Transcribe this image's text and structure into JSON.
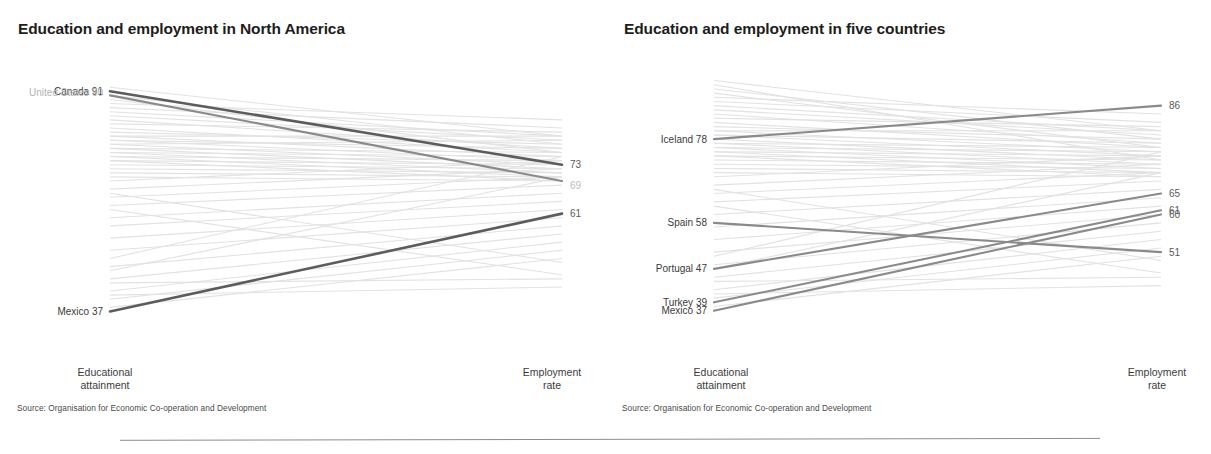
{
  "panels": [
    {
      "id": "north-america",
      "title": "Education and employment in North America",
      "axis_left": "Educational\nattainment",
      "axis_right": "Employment\nrate",
      "source": "Source: Organisation for Economic Co-operation and Development"
    },
    {
      "id": "five-countries",
      "title": "Education and employment in five countries",
      "axis_left": "Educational\nattainment",
      "axis_right": "Employment\nrate",
      "source": "Source: Organisation for Economic Co-operation and Development"
    }
  ],
  "colors": {
    "highlight_dark": "#5c5c5c",
    "highlight_mid": "#8a8a8a",
    "background_line": "#e2e2e2",
    "label_text": "#3a3a3a",
    "label_dim": "#b8b8b8",
    "title_text": "#1d1d1b",
    "rule": "#8d8d8d"
  },
  "chart_data": [
    {
      "type": "line",
      "subtype": "slopegraph",
      "title": "Education and employment in North America",
      "xlabel": "",
      "ylabel": "",
      "categories": [
        "Educational attainment",
        "Employment rate"
      ],
      "ylim": [
        30,
        95
      ],
      "grid": false,
      "legend": "none",
      "highlighted": [
        {
          "name": "Canada",
          "left_label": "Canada 91",
          "right_label": "73",
          "values": [
            91,
            73
          ],
          "emphasis": "dark"
        },
        {
          "name": "United States",
          "left_label": "United States 90",
          "right_label": "69",
          "values": [
            90,
            69
          ],
          "emphasis": "mid"
        },
        {
          "name": "Mexico",
          "left_label": "Mexico 37",
          "right_label": "61",
          "values": [
            37,
            61
          ],
          "emphasis": "dark"
        }
      ],
      "background_series": [
        {
          "values": [
            92,
            80
          ]
        },
        {
          "values": [
            90,
            78
          ]
        },
        {
          "values": [
            89,
            76
          ]
        },
        {
          "values": [
            88,
            84
          ]
        },
        {
          "values": [
            87,
            82
          ]
        },
        {
          "values": [
            86,
            80
          ]
        },
        {
          "values": [
            85,
            79
          ]
        },
        {
          "values": [
            84,
            77
          ]
        },
        {
          "values": [
            83,
            81
          ]
        },
        {
          "values": [
            82,
            76
          ]
        },
        {
          "values": [
            81,
            78
          ]
        },
        {
          "values": [
            80,
            75
          ]
        },
        {
          "values": [
            80,
            80
          ]
        },
        {
          "values": [
            79,
            74
          ]
        },
        {
          "values": [
            79,
            77
          ]
        },
        {
          "values": [
            78,
            73
          ]
        },
        {
          "values": [
            78,
            79
          ]
        },
        {
          "values": [
            77,
            72
          ]
        },
        {
          "values": [
            77,
            76
          ]
        },
        {
          "values": [
            76,
            71
          ]
        },
        {
          "values": [
            76,
            75
          ]
        },
        {
          "values": [
            75,
            74
          ]
        },
        {
          "values": [
            75,
            70
          ]
        },
        {
          "values": [
            74,
            73
          ]
        },
        {
          "values": [
            74,
            69
          ]
        },
        {
          "values": [
            73,
            72
          ]
        },
        {
          "values": [
            72,
            71
          ]
        },
        {
          "values": [
            71,
            70
          ]
        },
        {
          "values": [
            70,
            69
          ]
        },
        {
          "values": [
            69,
            74
          ]
        },
        {
          "values": [
            67,
            72
          ]
        },
        {
          "values": [
            65,
            70
          ]
        },
        {
          "values": [
            63,
            68
          ]
        },
        {
          "values": [
            60,
            66
          ]
        },
        {
          "values": [
            58,
            64
          ]
        },
        {
          "values": [
            55,
            62
          ]
        },
        {
          "values": [
            52,
            60
          ]
        },
        {
          "values": [
            48,
            58
          ]
        },
        {
          "values": [
            45,
            56
          ]
        },
        {
          "values": [
            42,
            54
          ]
        },
        {
          "values": [
            40,
            52
          ]
        },
        {
          "values": [
            38,
            50
          ]
        },
        {
          "values": [
            50,
            75
          ]
        },
        {
          "values": [
            47,
            70
          ]
        },
        {
          "values": [
            44,
            45
          ]
        },
        {
          "values": [
            41,
            43
          ]
        },
        {
          "values": [
            66,
            49
          ]
        },
        {
          "values": [
            62,
            46
          ]
        }
      ]
    },
    {
      "type": "line",
      "subtype": "slopegraph",
      "title": "Education and employment in five countries",
      "xlabel": "",
      "ylabel": "",
      "categories": [
        "Educational attainment",
        "Employment rate"
      ],
      "ylim": [
        30,
        95
      ],
      "grid": false,
      "legend": "none",
      "highlighted": [
        {
          "name": "Iceland",
          "left_label": "Iceland 78",
          "right_label": "86",
          "values": [
            78,
            86
          ],
          "emphasis": "mid"
        },
        {
          "name": "Spain",
          "left_label": "Spain 58",
          "right_label": "51",
          "values": [
            58,
            51
          ],
          "emphasis": "mid"
        },
        {
          "name": "Portugal",
          "left_label": "Portugal 47",
          "right_label": "65",
          "values": [
            47,
            65
          ],
          "emphasis": "mid"
        },
        {
          "name": "Turkey",
          "left_label": "Turkey 39",
          "right_label": "61",
          "values": [
            39,
            61
          ],
          "emphasis": "mid"
        },
        {
          "name": "Mexico",
          "left_label": "Mexico 37",
          "right_label": "60",
          "values": [
            37,
            60
          ],
          "emphasis": "mid"
        }
      ],
      "background_series": [
        {
          "values": [
            92,
            80
          ]
        },
        {
          "values": [
            91,
            73
          ]
        },
        {
          "values": [
            90,
            78
          ]
        },
        {
          "values": [
            89,
            76
          ]
        },
        {
          "values": [
            88,
            84
          ]
        },
        {
          "values": [
            87,
            82
          ]
        },
        {
          "values": [
            86,
            80
          ]
        },
        {
          "values": [
            85,
            79
          ]
        },
        {
          "values": [
            84,
            77
          ]
        },
        {
          "values": [
            83,
            81
          ]
        },
        {
          "values": [
            82,
            76
          ]
        },
        {
          "values": [
            81,
            78
          ]
        },
        {
          "values": [
            80,
            75
          ]
        },
        {
          "values": [
            80,
            80
          ]
        },
        {
          "values": [
            79,
            74
          ]
        },
        {
          "values": [
            79,
            77
          ]
        },
        {
          "values": [
            78,
            73
          ]
        },
        {
          "values": [
            77,
            72
          ]
        },
        {
          "values": [
            77,
            76
          ]
        },
        {
          "values": [
            76,
            71
          ]
        },
        {
          "values": [
            76,
            75
          ]
        },
        {
          "values": [
            75,
            74
          ]
        },
        {
          "values": [
            75,
            70
          ]
        },
        {
          "values": [
            74,
            73
          ]
        },
        {
          "values": [
            74,
            69
          ]
        },
        {
          "values": [
            73,
            72
          ]
        },
        {
          "values": [
            72,
            71
          ]
        },
        {
          "values": [
            71,
            70
          ]
        },
        {
          "values": [
            70,
            69
          ]
        },
        {
          "values": [
            69,
            74
          ]
        },
        {
          "values": [
            67,
            72
          ]
        },
        {
          "values": [
            65,
            70
          ]
        },
        {
          "values": [
            63,
            68
          ]
        },
        {
          "values": [
            60,
            66
          ]
        },
        {
          "values": [
            57,
            64
          ]
        },
        {
          "values": [
            54,
            62
          ]
        },
        {
          "values": [
            51,
            60
          ]
        },
        {
          "values": [
            48,
            58
          ]
        },
        {
          "values": [
            45,
            56
          ]
        },
        {
          "values": [
            42,
            54
          ]
        },
        {
          "values": [
            40,
            52
          ]
        },
        {
          "values": [
            38,
            50
          ]
        },
        {
          "values": [
            50,
            75
          ]
        },
        {
          "values": [
            47,
            70
          ]
        },
        {
          "values": [
            44,
            45
          ]
        },
        {
          "values": [
            41,
            43
          ]
        },
        {
          "values": [
            66,
            49
          ]
        },
        {
          "values": [
            62,
            46
          ]
        }
      ]
    }
  ]
}
